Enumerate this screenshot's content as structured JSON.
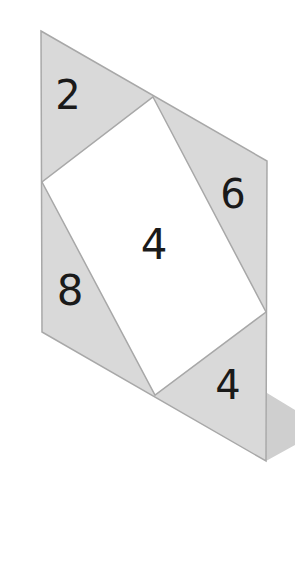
{
  "diagram": {
    "type": "skewed-rectangle-area-puzzle",
    "colors": {
      "background": "#ffffff",
      "triangle_fill": "#d9d9d9",
      "rectangle_fill": "#ffffff",
      "edge": "#a8a8a8",
      "shadow": "#cfcfcf",
      "text": "#1a1a1a"
    },
    "outer_parallelogram": [
      [
        41,
        31
      ],
      [
        267,
        161
      ],
      [
        266,
        461
      ],
      [
        42,
        332
      ]
    ],
    "inner_rectangle": [
      [
        153,
        97
      ],
      [
        266,
        312
      ],
      [
        155,
        395
      ],
      [
        42,
        182
      ]
    ],
    "shadow": [
      [
        267,
        393
      ],
      [
        295,
        410
      ],
      [
        295,
        445
      ],
      [
        266,
        461
      ]
    ],
    "regions": [
      {
        "id": "top-left-triangle",
        "label": "2",
        "points": [
          [
            41,
            31
          ],
          [
            153,
            97
          ],
          [
            42,
            182
          ]
        ],
        "label_pos": [
          68,
          98
        ]
      },
      {
        "id": "top-right-triangle",
        "label": "6",
        "points": [
          [
            153,
            97
          ],
          [
            267,
            161
          ],
          [
            266,
            312
          ]
        ],
        "label_pos": [
          233,
          196
        ]
      },
      {
        "id": "center-rectangle",
        "label": "4",
        "points": [
          [
            153,
            97
          ],
          [
            266,
            312
          ],
          [
            155,
            395
          ],
          [
            42,
            182
          ]
        ],
        "label_pos": [
          154,
          246
        ]
      },
      {
        "id": "bottom-left-triangle",
        "label": "8",
        "points": [
          [
            42,
            182
          ],
          [
            155,
            395
          ],
          [
            42,
            332
          ]
        ],
        "label_pos": [
          70,
          292
        ]
      },
      {
        "id": "bottom-right-triangle",
        "label": "4",
        "points": [
          [
            266,
            312
          ],
          [
            266,
            461
          ],
          [
            155,
            395
          ]
        ],
        "label_pos": [
          228,
          387
        ]
      }
    ]
  }
}
